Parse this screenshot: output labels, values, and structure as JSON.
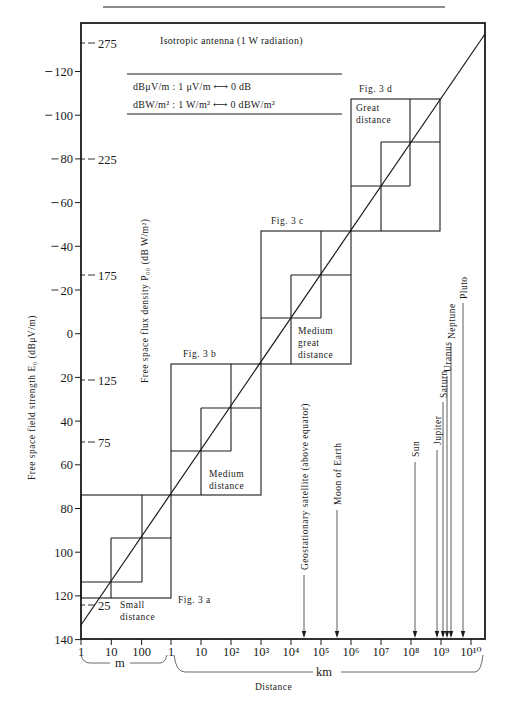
{
  "chart_data": {
    "type": "line",
    "title": "Isotropic antenna (1 W radiation)",
    "notes": [
      "dBμV/m : 1 μV/m ⟷ 0 dB",
      "dBW/m² : 1 W/m² ⟷ 0 dBW/m²"
    ],
    "xlabel": "Distance",
    "x_scale": "log",
    "x_units": [
      {
        "name": "m",
        "ticks": [
          "1",
          "10",
          "100"
        ]
      },
      {
        "name": "km",
        "ticks": [
          "1",
          "10",
          "10²",
          "10³",
          "10⁴",
          "10⁵",
          "10⁶",
          "10⁷",
          "10⁸",
          "10⁹",
          "10¹⁰"
        ]
      }
    ],
    "ylabel_left": "Free space field strength E₀ (dBμV/m)",
    "yticks_left": [
      "−120",
      "−100",
      "−80",
      "−60",
      "−40",
      "−20",
      "0",
      "20",
      "40",
      "60",
      "80",
      "100",
      "120",
      "140"
    ],
    "ylim_left": [
      140,
      -125
    ],
    "ylabel_right": "Free space flux density P₀₀ (dB W/m²)",
    "yticks_right": [
      "275",
      "225",
      "175",
      "125",
      "75",
      "25"
    ],
    "series": [
      {
        "name": "Isotropic antenna 1 W",
        "slope": "-20 dB per decade",
        "points": [
          {
            "distance": "1 m",
            "field_dBuV_per_m": 135
          },
          {
            "distance": "10 m",
            "field_dBuV_per_m": 115
          },
          {
            "distance": "100 m",
            "field_dBuV_per_m": 95
          },
          {
            "distance": "1 km",
            "field_dBuV_per_m": 75
          },
          {
            "distance": "10 km",
            "field_dBuV_per_m": 55
          },
          {
            "distance": "100 km",
            "field_dBuV_per_m": 35
          },
          {
            "distance": "1000 km",
            "field_dBuV_per_m": 15
          },
          {
            "distance": "10^4 km",
            "field_dBuV_per_m": -5
          },
          {
            "distance": "10^5 km",
            "field_dBuV_per_m": -25
          },
          {
            "distance": "10^6 km",
            "field_dBuV_per_m": -45
          },
          {
            "distance": "10^7 km",
            "field_dBuV_per_m": -65
          },
          {
            "distance": "10^8 km",
            "field_dBuV_per_m": -85
          },
          {
            "distance": "10^9 km",
            "field_dBuV_per_m": -105
          },
          {
            "distance": "10^10 km",
            "field_dBuV_per_m": -125
          }
        ]
      }
    ],
    "regions": [
      {
        "fig": "Fig. 3 a",
        "label": "Small distance",
        "range": "1 m – 1 km"
      },
      {
        "fig": "Fig. 3 b",
        "label": "Medium distance",
        "range": "1 km – 10³ km"
      },
      {
        "fig": "Fig. 3 c",
        "label": "Medium great distance",
        "range": "10³ km – 10⁶ km"
      },
      {
        "fig": "Fig. 3 d",
        "label": "Great distance",
        "range": "10⁶ km – 10⁹ km"
      }
    ],
    "annotations": [
      {
        "label": "Geostationary satellite (above equator)",
        "distance_km": "3.6×10⁴"
      },
      {
        "label": "Moon of Earth",
        "distance_km": "3.8×10⁵"
      },
      {
        "label": "Sun",
        "distance_km": "1.5×10⁸"
      },
      {
        "label": "Jupiter",
        "distance_km": "7.8×10⁸"
      },
      {
        "label": "Saturn",
        "distance_km": "1.4×10⁹"
      },
      {
        "label": "Uranus",
        "distance_km": "2.9×10⁹"
      },
      {
        "label": "Neptune",
        "distance_km": "4.5×10⁹"
      },
      {
        "label": "Pluto",
        "distance_km": "5.9×10⁹"
      }
    ],
    "grid": false,
    "legend": "none"
  }
}
